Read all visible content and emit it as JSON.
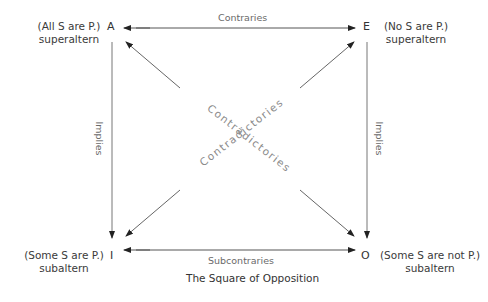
{
  "diagram": {
    "title": "The Square of Opposition",
    "corners": {
      "A": {
        "letter": "A",
        "proposition": "(All S are P.)",
        "role": "superaltern"
      },
      "E": {
        "letter": "E",
        "proposition": "(No S are P.)",
        "role": "superaltern"
      },
      "I": {
        "letter": "I",
        "proposition": "(Some S are P.)",
        "role": "subaltern"
      },
      "O": {
        "letter": "O",
        "proposition": "(Some S are not P.)",
        "role": "subaltern"
      }
    },
    "relations": {
      "top": "Contraries",
      "bottom": "Subcontraries",
      "left": "Implies",
      "right": "Implies",
      "diagonal_1": "Contradictories",
      "diagonal_2": "Contradictories"
    },
    "colors": {
      "line": "#666666",
      "text": "#333333",
      "muted": "#8a8a8a"
    }
  }
}
